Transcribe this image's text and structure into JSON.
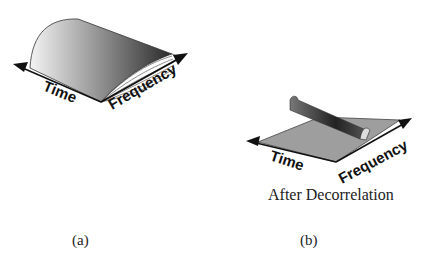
{
  "figure_a": {
    "label": "(a)",
    "axes": {
      "x": "Time",
      "y": "Frequency"
    }
  },
  "figure_b": {
    "label": "(b)",
    "caption": "After Decorrelation",
    "axes": {
      "x": "Time",
      "y": "Frequency"
    }
  },
  "colors": {
    "background": "#ffffff",
    "ink": "#111111"
  }
}
